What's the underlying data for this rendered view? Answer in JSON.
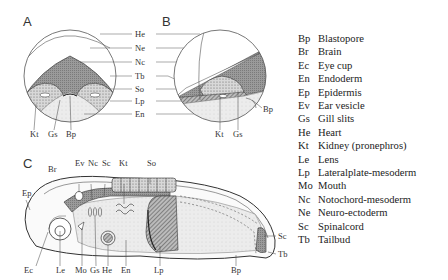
{
  "panels": {
    "A": "A",
    "B": "B",
    "C": "C"
  },
  "center_labels": [
    "He",
    "Ne",
    "Nc",
    "Tb",
    "So",
    "Lp",
    "En"
  ],
  "panel_a_bottom_labels": [
    "Kt",
    "Gs",
    "Bp"
  ],
  "panel_b_labels": {
    "kt": "Kt",
    "gs": "Gs",
    "bp": "Bp"
  },
  "panel_c_labels": {
    "ep": "Ep",
    "br": "Br",
    "ev": "Ev",
    "nc": "Nc",
    "sc_top": "Sc",
    "kt": "Kt",
    "so": "So",
    "ec": "Ec",
    "le": "Le",
    "mo": "Mo",
    "gs": "Gs",
    "he": "He",
    "en": "En",
    "lp": "Lp",
    "bp": "Bp",
    "sc_right": "Sc",
    "tb": "Tb"
  },
  "legend": [
    {
      "abbr": "Bp",
      "term": "Blastopore"
    },
    {
      "abbr": "Br",
      "term": "Brain"
    },
    {
      "abbr": "Ec",
      "term": "Eye cup"
    },
    {
      "abbr": "En",
      "term": "Endoderm"
    },
    {
      "abbr": "Ep",
      "term": "Epidermis"
    },
    {
      "abbr": "Ev",
      "term": "Ear vesicle"
    },
    {
      "abbr": "Gs",
      "term": "Gill slits"
    },
    {
      "abbr": "He",
      "term": "Heart"
    },
    {
      "abbr": "Kt",
      "term": "Kidney (pronephros)"
    },
    {
      "abbr": "Le",
      "term": "Lens"
    },
    {
      "abbr": "Lp",
      "term": "Lateralplate-mesoderm"
    },
    {
      "abbr": "Mo",
      "term": "Mouth"
    },
    {
      "abbr": "Nc",
      "term": "Notochord-mesoderm"
    },
    {
      "abbr": "Ne",
      "term": "Neuro-ectoderm"
    },
    {
      "abbr": "Sc",
      "term": "Spinalcord"
    },
    {
      "abbr": "Tb",
      "term": "Tailbud"
    }
  ]
}
